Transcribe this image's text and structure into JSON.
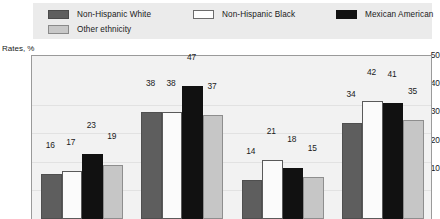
{
  "legend": {
    "entries": [
      {
        "label": "Non-Hispanic White",
        "swatch": "dark-gray-swatch-icon",
        "color": "#5e5e5e"
      },
      {
        "label": "Non-Hispanic Black",
        "swatch": "white-swatch-icon",
        "color": "#ffffff"
      },
      {
        "label": "Mexican American",
        "swatch": "black-swatch-icon",
        "color": "#111111"
      },
      {
        "label": "Other ethnicity",
        "swatch": "light-gray-swatch-icon",
        "color": "#c6c6c6"
      }
    ]
  },
  "chart_data": {
    "type": "bar",
    "title": "",
    "ylabel": "Rates, %",
    "xlabel": "",
    "ylim": [
      0,
      50
    ],
    "yticks": [
      10,
      20,
      30,
      40,
      50
    ],
    "grid": true,
    "legend_position": "top",
    "categories": [
      "Group 1",
      "Group 2",
      "Group 3",
      "Group 4"
    ],
    "series": [
      {
        "name": "Non-Hispanic White",
        "color": "#5e5e5e",
        "values": [
          16,
          38,
          14,
          34
        ]
      },
      {
        "name": "Non-Hispanic Black",
        "color": "#ffffff",
        "values": [
          17,
          38,
          21,
          42
        ]
      },
      {
        "name": "Mexican American",
        "color": "#111111",
        "values": [
          23,
          47,
          18,
          41
        ]
      },
      {
        "name": "Other ethnicity",
        "color": "#c6c6c6",
        "values": [
          19,
          37,
          15,
          35
        ]
      }
    ]
  }
}
